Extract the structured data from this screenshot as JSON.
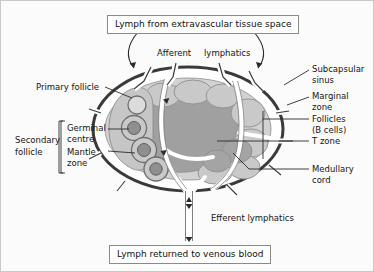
{
  "figure": {
    "title_box_top": "Lymph from extravascular tissue space",
    "title_box_bottom": "Lymph returned to venous blood",
    "background_color": "#fbfbfb",
    "border_color": "#c9c9c9"
  },
  "labels": {
    "afferent": "Afferent",
    "lymphatics": "lymphatics",
    "efferent_lymphatics": "Efferent lymphatics",
    "primary_follicle": "Primary follicle",
    "secondary_follicle_line1": "Secondary",
    "secondary_follicle_line2": "follicle",
    "germinal_line1": "Germinal",
    "germinal_line2": "centre",
    "mantle_line1": "Mantle",
    "mantle_line2": "zone",
    "subcapsular_line1": "Subcapsular",
    "subcapsular_line2": "sinus",
    "marginal_line1": "Marginal",
    "marginal_line2": "zone",
    "follicles_line1": "Follicles",
    "follicles_line2": "(B cells)",
    "t_zone": "T zone",
    "medullary_line1": "Medullary",
    "medullary_line2": "cord"
  },
  "colors": {
    "capsule_outline": "#3a3a3a",
    "sinus_white": "#ffffff",
    "cortex_light_grey": "#d2d2d2",
    "follicle_grey": "#c3c3c3",
    "medulla_dark_grey": "#a0a0a0",
    "t_zone_grey": "#b4b4b4",
    "leader_line": "#2b2b2b",
    "text": "#151515"
  }
}
